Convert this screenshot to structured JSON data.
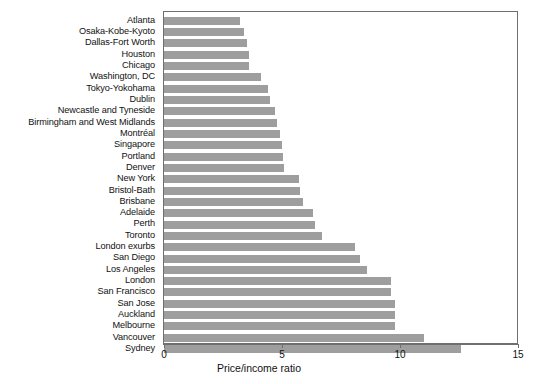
{
  "chart_data": {
    "type": "bar",
    "orientation": "horizontal",
    "title": "",
    "xlabel": "Price/income ratio",
    "ylabel": "",
    "xlim": [
      0,
      15
    ],
    "xticks": [
      0,
      5,
      10,
      15
    ],
    "xtick_labels": [
      "0",
      "5",
      "10",
      "15"
    ],
    "grid": false,
    "legend": null,
    "bar_color": "#9e9e9e",
    "frame_color": "#6f6f6f",
    "categories": [
      "Atlanta",
      "Osaka-Kobe-Kyoto",
      "Dallas-Fort Worth",
      "Houston",
      "Chicago",
      "Washington, DC",
      "Tokyo-Yokohama",
      "Dublin",
      "Newcastle and Tyneside",
      "Birmingham and West Midlands",
      "Montréal",
      "Singapore",
      "Portland",
      "Denver",
      "New York",
      "Bristol-Bath",
      "Brisbane",
      "Adelaide",
      "Perth",
      "Toronto",
      "London exurbs",
      "San Diego",
      "Los Angeles",
      "London",
      "San Francisco",
      "San Jose",
      "Auckland",
      "Melbourne",
      "Vancouver",
      "Sydney"
    ],
    "values": [
      3.2,
      3.4,
      3.5,
      3.6,
      3.6,
      4.1,
      4.4,
      4.5,
      4.7,
      4.8,
      4.9,
      5.0,
      5.05,
      5.1,
      5.7,
      5.75,
      5.9,
      6.3,
      6.4,
      6.7,
      8.1,
      8.3,
      8.6,
      9.6,
      9.6,
      9.8,
      9.8,
      9.8,
      11.0,
      12.6
    ]
  }
}
